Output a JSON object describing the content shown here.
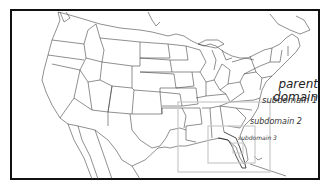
{
  "map": {
    "region": "Continental United States",
    "frame_color": "#111111",
    "border_color": "#333333",
    "domain_box_color": "#c8c8c8"
  },
  "labels": {
    "parent_line1": "parent",
    "parent_line2": "domain",
    "subdomain1": "subdomain 1",
    "subdomain2": "subdomain 2",
    "subdomain3": "subdomain 3"
  },
  "domains": [
    {
      "name": "parent domain",
      "x": 11,
      "y": 10,
      "w": 308,
      "h": 169
    },
    {
      "name": "subdomain 1",
      "x": 178,
      "y": 102,
      "w": 92,
      "h": 70
    },
    {
      "name": "subdomain 2",
      "x": 208,
      "y": 126,
      "w": 47,
      "h": 37
    },
    {
      "name": "subdomain 3",
      "x": 233,
      "y": 143,
      "w": 10,
      "h": 10
    }
  ]
}
